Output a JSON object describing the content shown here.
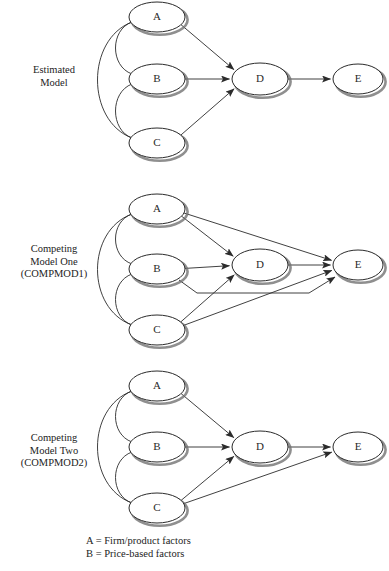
{
  "figure": {
    "background": "#ffffff",
    "stroke": "#2b2b2b",
    "shadow": "#6f6f6f",
    "node_fill": "#ffffff"
  },
  "rows": [
    {
      "id": "estimated-model",
      "label_lines": [
        "Estimated",
        "Model"
      ],
      "label_top": 64,
      "nodes": [
        {
          "id": "A",
          "label": "A",
          "cx": 157,
          "cy": 17,
          "rx": 28,
          "ry": 15
        },
        {
          "id": "B",
          "label": "B",
          "cx": 157,
          "cy": 79,
          "rx": 28,
          "ry": 15
        },
        {
          "id": "C",
          "label": "C",
          "cx": 157,
          "cy": 143,
          "rx": 28,
          "ry": 15
        },
        {
          "id": "D",
          "label": "D",
          "cx": 260,
          "cy": 79,
          "rx": 28,
          "ry": 16
        },
        {
          "id": "E",
          "label": "E",
          "cx": 358,
          "cy": 79,
          "rx": 25,
          "ry": 15
        }
      ],
      "paths": [
        "A->D",
        "B->D",
        "C->D",
        "D->E"
      ],
      "correlations": [
        "A<->B",
        "B<->C",
        "A<->C"
      ]
    },
    {
      "id": "competing-model-one",
      "label_lines": [
        "Competing",
        "Model One",
        "(COMPMOD1)"
      ],
      "label_top": 243,
      "nodes": [
        {
          "id": "A",
          "label": "A",
          "cx": 157,
          "cy": 209,
          "rx": 28,
          "ry": 15
        },
        {
          "id": "B",
          "label": "B",
          "cx": 157,
          "cy": 269,
          "rx": 28,
          "ry": 15
        },
        {
          "id": "C",
          "label": "C",
          "cx": 157,
          "cy": 330,
          "rx": 28,
          "ry": 15
        },
        {
          "id": "D",
          "label": "D",
          "cx": 260,
          "cy": 265,
          "rx": 28,
          "ry": 16
        },
        {
          "id": "E",
          "label": "E",
          "cx": 358,
          "cy": 265,
          "rx": 25,
          "ry": 15
        }
      ],
      "paths": [
        "A->D",
        "A->E",
        "B->D",
        "B->E",
        "C->D",
        "C->E",
        "D->E"
      ],
      "correlations": [
        "A<->B",
        "B<->C",
        "A<->C"
      ]
    },
    {
      "id": "competing-model-two",
      "label_lines": [
        "Competing",
        "Model Two",
        "(COMPMOD2)"
      ],
      "label_top": 432,
      "nodes": [
        {
          "id": "A",
          "label": "A",
          "cx": 157,
          "cy": 386,
          "rx": 28,
          "ry": 15
        },
        {
          "id": "B",
          "label": "B",
          "cx": 157,
          "cy": 447,
          "rx": 28,
          "ry": 15
        },
        {
          "id": "C",
          "label": "C",
          "cx": 157,
          "cy": 508,
          "rx": 28,
          "ry": 15
        },
        {
          "id": "D",
          "label": "D",
          "cx": 260,
          "cy": 447,
          "rx": 28,
          "ry": 16
        },
        {
          "id": "E",
          "label": "E",
          "cx": 358,
          "cy": 447,
          "rx": 25,
          "ry": 15
        }
      ],
      "paths": [
        "A->D",
        "B->D",
        "C->D",
        "C->E",
        "D->E"
      ],
      "correlations": [
        "A<->B",
        "B<->C",
        "A<->C"
      ]
    }
  ],
  "legend": {
    "lines": [
      "A = Firm/product factors",
      "B = Price-based factors"
    ]
  }
}
